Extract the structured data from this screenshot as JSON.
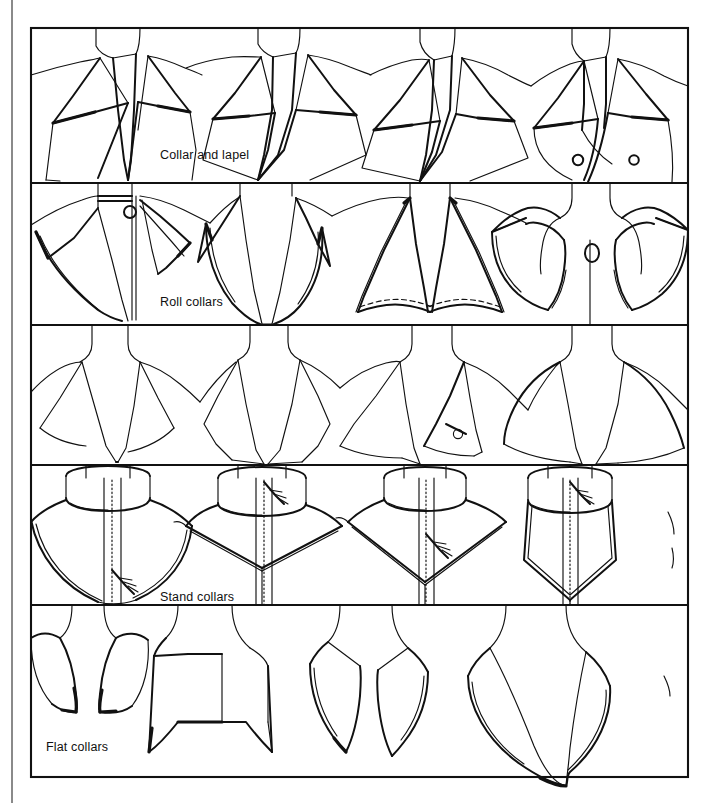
{
  "page": {
    "background_color": "#ffffff",
    "ink_color": "#111111",
    "spine_color": "#8a8a8a",
    "frame": {
      "x": 31,
      "y": 28,
      "width": 657,
      "height": 749
    }
  },
  "rows": [
    {
      "id": "row-collar-and-lapel",
      "label": "Collar and lapel",
      "label_x": 160,
      "label_y": 155,
      "top": 28,
      "bottom": 183,
      "figure_count": 4,
      "figures": [
        "notched-lapel-jacket",
        "peaked-lapel-jacket",
        "wide-notched-lapel-jacket",
        "double-breasted-lapel-jacket"
      ]
    },
    {
      "id": "row-roll-collars",
      "label": "Roll collars",
      "label_x": 160,
      "label_y": 302,
      "top": 183,
      "bottom": 325,
      "figure_count": 4,
      "figures": [
        "roll-collar-buttoned-stand",
        "roll-collar-open-v",
        "roll-collar-flared-topstitched",
        "roll-collar-round-peter-pan"
      ]
    },
    {
      "id": "row-unlabeled-shawl",
      "label": "",
      "top": 325,
      "bottom": 465,
      "figure_count": 4,
      "figures": [
        "shawl-collar-open",
        "shawl-collar-pointed",
        "shawl-collar-buttoned-tab",
        "shawl-collar-wide-cape"
      ]
    },
    {
      "id": "row-stand-collars",
      "label": "Stand collars",
      "label_x": 160,
      "label_y": 597,
      "top": 465,
      "bottom": 605,
      "figure_count": 4,
      "figures": [
        "stand-collar-round-yoke",
        "stand-collar-pointed-yoke",
        "stand-collar-v-yoke",
        "stand-collar-shield-yoke"
      ]
    },
    {
      "id": "row-flat-collars",
      "label": "Flat collars",
      "label_x": 46,
      "label_y": 748,
      "top": 605,
      "bottom": 777,
      "figure_count": 4,
      "figures": [
        "flat-collar-split-round",
        "flat-collar-square-sailor",
        "flat-collar-long-points",
        "flat-collar-deep-v"
      ]
    }
  ]
}
